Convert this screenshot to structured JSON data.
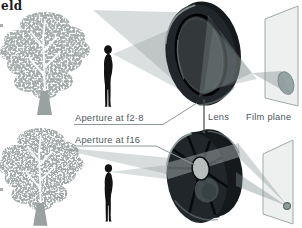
{
  "page": {
    "heading_fragment": "eld",
    "background": "#ffffff"
  },
  "labels": {
    "aperture_top": "Aperture at f2·8",
    "aperture_bottom": "Aperture at f16",
    "lens": "Lens",
    "film_plane": "Film plane"
  },
  "colors": {
    "heading_text": "#1c1c1c",
    "label_text": "#4d575b",
    "leader_line": "#8e9898",
    "connector_line": "#3f4747",
    "cone": "#808b8b",
    "cone_streak": "#a6aeae",
    "tree_foliage": "#a3a9a9",
    "tree_trunk": "#9aa1a1",
    "branch": "#ffffff",
    "person": "#121212",
    "lens_body": "#15191b",
    "lens_face": "#20262a",
    "lens_highlight": "#99a1a1",
    "aperture_opening": "#b6bdbd",
    "film_plane_fill": "#edefef",
    "film_plane_stroke": "#9fa9a9",
    "blur_spot": "#8e9c9c"
  }
}
